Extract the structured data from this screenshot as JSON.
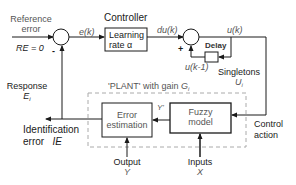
{
  "diagram": {
    "reference": {
      "line1": "Reference",
      "line2": "error",
      "value": "RE = 0"
    },
    "error_signal": "e(k)",
    "controller": {
      "title": "Controller",
      "line1": "Learning",
      "line2": "rate  α"
    },
    "du_signal": "du(k)",
    "u_signal": "u(k)",
    "delay": {
      "label": "Delay"
    },
    "u_prev_signal": "u(k-1)",
    "plus_sign": "+",
    "minus_sign": "-",
    "singletons": {
      "label": "Singletons",
      "symbol": "U",
      "subscript": "i"
    },
    "response": {
      "label": "Response",
      "symbol": "E",
      "subscript": "i"
    },
    "plant": {
      "label": "'PLANT' with gain ",
      "symbol": "G",
      "subscript": "i"
    },
    "error_estimation": {
      "line1": "Error",
      "line2": "estimation"
    },
    "y_prime": "Y'",
    "fuzzy_model": {
      "line1": "Fuzzy",
      "line2": "model"
    },
    "identification_error": {
      "line1": "Identification",
      "line2": "error",
      "symbol": "IE"
    },
    "control_action": {
      "line1": "Control",
      "line2": "action"
    },
    "output": {
      "label": "Output",
      "symbol": "Y"
    },
    "inputs": {
      "label": "Inputs",
      "symbol": "X"
    },
    "colors": {
      "line": "#1a1a1a",
      "dashed": "#aaaaaa"
    }
  }
}
